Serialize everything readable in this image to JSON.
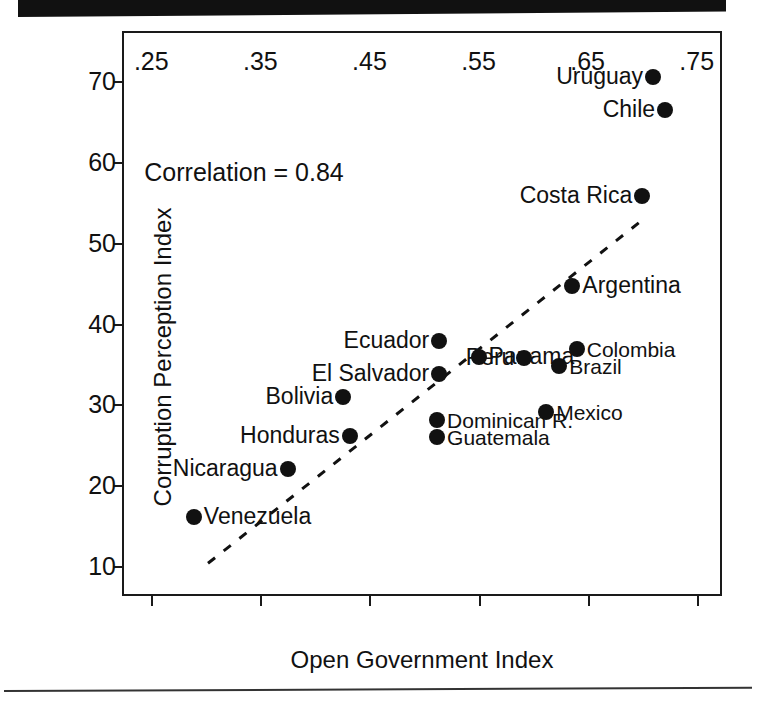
{
  "figure": {
    "has_top_bar": true,
    "has_bottom_rule": true
  },
  "chart_data": {
    "type": "scatter",
    "title": "",
    "xlabel": "Open Government Index",
    "ylabel": "Corruption Perception Index",
    "xlim": [
      0.225,
      0.775
    ],
    "ylim": [
      6,
      76
    ],
    "xticks": [
      ".25",
      ".35",
      ".45",
      ".55",
      ".65",
      ".75"
    ],
    "xtick_values": [
      0.25,
      0.35,
      0.45,
      0.55,
      0.65,
      0.75
    ],
    "yticks": [
      "70",
      "60",
      "50",
      "40",
      "30",
      "20",
      "10"
    ],
    "ytick_values": [
      70,
      60,
      50,
      40,
      30,
      20,
      10
    ],
    "grid": false,
    "legend": "none",
    "annotations": [
      {
        "text": "Correlation = 0.84",
        "x": 0.335,
        "y": 58.5
      }
    ],
    "trendline": {
      "style": "dashed",
      "x_start": 0.302,
      "y_start": 10.3,
      "x_end": 0.698,
      "y_end": 52.6
    },
    "points": [
      {
        "label": "Uruguay",
        "x": 0.71,
        "y": 70.6,
        "label_side": "left"
      },
      {
        "label": "Chile",
        "x": 0.721,
        "y": 66.5,
        "label_side": "left"
      },
      {
        "label": "Costa Rica",
        "x": 0.7,
        "y": 55.8,
        "label_side": "left"
      },
      {
        "label": "Argentina",
        "x": 0.636,
        "y": 44.7,
        "label_side": "right"
      },
      {
        "label": "Ecuador",
        "x": 0.514,
        "y": 37.8,
        "label_side": "left"
      },
      {
        "label": "Colombia",
        "x": 0.64,
        "y": 36.8,
        "label_side": "right"
      },
      {
        "label": "Panama",
        "x": 0.55,
        "y": 35.8,
        "label_side": "right"
      },
      {
        "label": "Peru",
        "x": 0.592,
        "y": 35.7,
        "label_side": "left"
      },
      {
        "label": "Brazil",
        "x": 0.624,
        "y": 34.7,
        "label_side": "right"
      },
      {
        "label": "El Salvador",
        "x": 0.514,
        "y": 33.8,
        "label_side": "left"
      },
      {
        "label": "Bolivia",
        "x": 0.426,
        "y": 30.9,
        "label_side": "left"
      },
      {
        "label": "Mexico",
        "x": 0.612,
        "y": 29.0,
        "label_side": "right"
      },
      {
        "label": "Dominican R.",
        "x": 0.512,
        "y": 28.0,
        "label_side": "right"
      },
      {
        "label": "Guatemala",
        "x": 0.512,
        "y": 25.9,
        "label_side": "right"
      },
      {
        "label": "Honduras",
        "x": 0.432,
        "y": 26.1,
        "label_side": "left"
      },
      {
        "label": "Nicaragua",
        "x": 0.375,
        "y": 22.0,
        "label_side": "left"
      },
      {
        "label": "Venezuela",
        "x": 0.289,
        "y": 16.0,
        "label_side": "right"
      }
    ]
  }
}
